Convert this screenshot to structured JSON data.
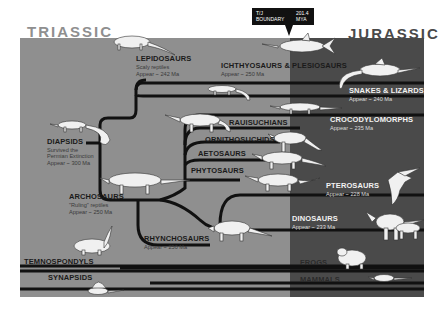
{
  "periods": {
    "triassic": "TRIASSIC",
    "jurassic": "JURASSIC"
  },
  "boundary": {
    "label_line1": "T/J",
    "label_line2": "BOUNDARY",
    "value_line1": "201.4",
    "value_line2": "MYA"
  },
  "colors": {
    "triassic_bg": "#8f8f8f",
    "jurassic_bg": "#4a4a4a",
    "branch": "#111111",
    "animal": "#f0f0f0"
  },
  "groups": [
    {
      "id": "lepidosaurs",
      "name": "LEPIDOSAURS",
      "desc": "Scaly reptiles",
      "appear": "Appear ~ 242 Ma"
    },
    {
      "id": "ichthyosaurs",
      "name": "ICHTHYOSAURS & PLESIOSAURS",
      "appear": "Appear ~ 250 Ma"
    },
    {
      "id": "snakes",
      "name": "SNAKES & LIZARDS",
      "appear": "Appear ~ 240 Ma"
    },
    {
      "id": "diapsids",
      "name": "DIAPSIDS",
      "desc1": "Survived the",
      "desc2": "Permian Extinction",
      "appear": "Appear ~ 300 Ma"
    },
    {
      "id": "rauisuchians",
      "name": "RAUISUCHIANS"
    },
    {
      "id": "crocodylomorphs",
      "name": "CROCODYLOMORPHS",
      "appear": "Appear ~ 235 Ma"
    },
    {
      "id": "ornithosuchids",
      "name": "ORNITHOSUCHIDS"
    },
    {
      "id": "aetosaurs",
      "name": "AETOSAURS"
    },
    {
      "id": "phytosaurs",
      "name": "PHYTOSAURS"
    },
    {
      "id": "archosaurs",
      "name": "ARCHOSAURS",
      "desc": "\"Ruling\" reptiles",
      "appear": "Appear ~ 250 Ma"
    },
    {
      "id": "pterosaurs",
      "name": "PTEROSAURS",
      "appear": "Appear ~ 228 Ma"
    },
    {
      "id": "dinosaurs",
      "name": "DINOSAURS",
      "appear": "Appear ~ 233 Ma"
    },
    {
      "id": "rhynchosaurs",
      "name": "RHYNCHOSAURS",
      "appear": "Appear ~ 250 Ma"
    },
    {
      "id": "temnospondyls",
      "name": "TEMNOSPONDYLS"
    },
    {
      "id": "frogs",
      "name": "FROGS"
    },
    {
      "id": "synapsids",
      "name": "SYNAPSIDS"
    },
    {
      "id": "mammals",
      "name": "MAMMALS"
    }
  ]
}
